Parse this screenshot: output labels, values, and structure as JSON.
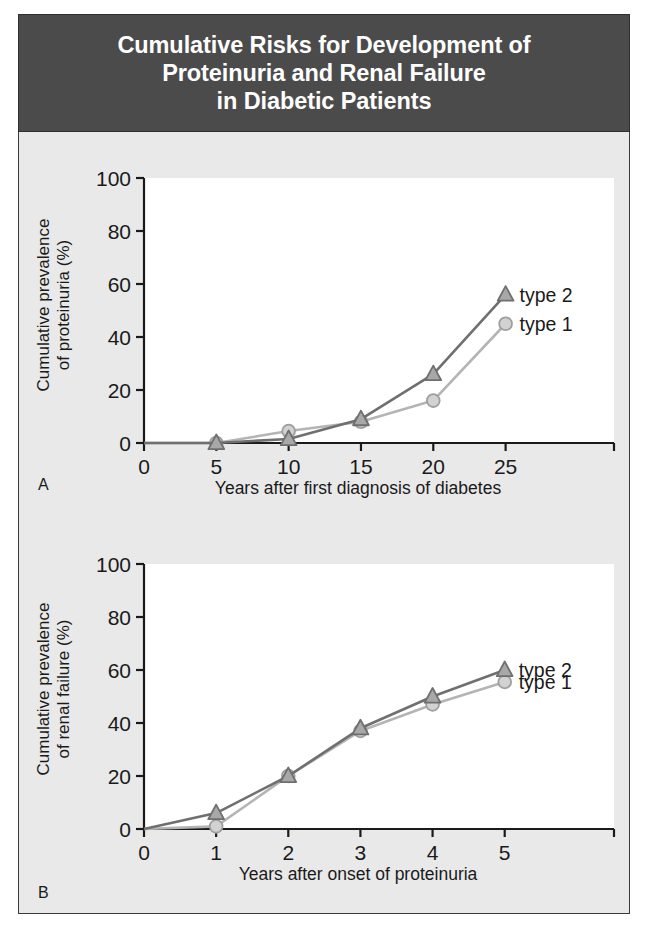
{
  "figure": {
    "title_lines": [
      "Cumulative Risks for Development of",
      "Proteinuria and Renal Failure",
      "in Diabetic Patients"
    ],
    "title_bg": "#4b4b4b",
    "title_color": "#ffffff",
    "panel_bg": "#e9e9e9",
    "plot_bg": "#ffffff",
    "border_color": "#3a3a3a"
  },
  "colors": {
    "type2_line": "#6f6f6f",
    "type2_marker_fill": "#a8a8a8",
    "type2_marker_stroke": "#6f6f6f",
    "type1_line": "#b4b4b4",
    "type1_marker_fill": "#d2d2d2",
    "type1_marker_stroke": "#9e9e9e",
    "axis": "#1a1a1a",
    "text": "#1a1a1a"
  },
  "legend": {
    "type2_label": "type 2",
    "type1_label": "type 1",
    "type2_marker": "triangle",
    "type1_marker": "circle"
  },
  "chart_data": [
    {
      "id": "A",
      "panel_letter": "A",
      "type": "line",
      "title": "",
      "xlabel": "Years after first diagnosis of diabetes",
      "ylabel": "Cumulative prevalence of proteinuria (%)",
      "ylabel_line1": "Cumulative prevalence",
      "ylabel_line2": "of proteinuria (%)",
      "x": [
        0,
        5,
        10,
        15,
        20,
        25
      ],
      "xticks": [
        0,
        5,
        10,
        15,
        20,
        25
      ],
      "yticks": [
        0,
        20,
        40,
        60,
        80,
        100
      ],
      "xlim": [
        0,
        28
      ],
      "ylim": [
        0,
        100
      ],
      "grid": false,
      "legend_position": "right-inside",
      "series": [
        {
          "name": "type 2",
          "marker": "triangle",
          "values": [
            0,
            0,
            1.5,
            9,
            26,
            56
          ]
        },
        {
          "name": "type 1",
          "marker": "circle",
          "values": [
            0,
            0,
            4.5,
            8,
            16,
            45
          ]
        }
      ]
    },
    {
      "id": "B",
      "panel_letter": "B",
      "type": "line",
      "title": "",
      "xlabel": "Years after onset of proteinuria",
      "ylabel": "Cumulative prevalence of renal failure (%)",
      "ylabel_line1": "Cumulative prevalence",
      "ylabel_line2": "of renal failure (%)",
      "x": [
        0,
        1,
        2,
        3,
        4,
        5
      ],
      "xticks": [
        0,
        1,
        2,
        3,
        4,
        5
      ],
      "yticks": [
        0,
        20,
        40,
        60,
        80,
        100
      ],
      "xlim": [
        0,
        5.6
      ],
      "ylim": [
        0,
        100
      ],
      "grid": false,
      "legend_position": "right-inside",
      "series": [
        {
          "name": "type 2",
          "marker": "triangle",
          "values": [
            0,
            6,
            20,
            38,
            50,
            60
          ]
        },
        {
          "name": "type 1",
          "marker": "circle",
          "values": [
            0,
            1,
            20,
            37,
            47,
            55.5
          ]
        }
      ]
    }
  ]
}
